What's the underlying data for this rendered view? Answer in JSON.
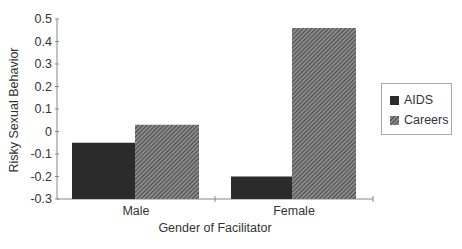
{
  "chart_data": {
    "type": "bar",
    "title": "",
    "xlabel": "Gender of Facilitator",
    "ylabel": "Risky Sexual Behavior",
    "categories": [
      "Male",
      "Female"
    ],
    "series": [
      {
        "name": "AIDS",
        "values": [
          -0.05,
          -0.2
        ],
        "color": "#2b2b2b",
        "pattern": "solid"
      },
      {
        "name": "Careers",
        "values": [
          0.03,
          0.46
        ],
        "color": "#6a6a6a",
        "pattern": "diagonal-hatch"
      }
    ],
    "ylim": [
      -0.3,
      0.5
    ],
    "yticks": [
      "0.5",
      "0.4",
      "0.3",
      "0.2",
      "0.1",
      "0",
      "-0.1",
      "-0.2",
      "-0.3"
    ],
    "bar_baseline": -0.3,
    "grid": false,
    "legend_position": "right"
  },
  "legend": {
    "items": [
      {
        "label": "AIDS"
      },
      {
        "label": "Careers"
      }
    ]
  }
}
